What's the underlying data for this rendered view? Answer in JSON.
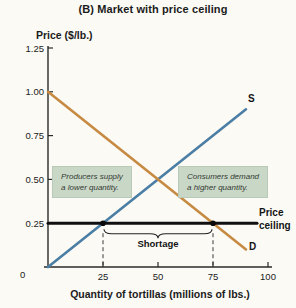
{
  "title": "(B) Market with price ceiling",
  "chart_data": {
    "type": "line",
    "title": "(B) Market with price ceiling",
    "xlabel": "Quantity of tortillas (millions of lbs.)",
    "ylabel": "Price ($/lb.)",
    "xlim": [
      0,
      100
    ],
    "ylim": [
      0,
      1.25
    ],
    "grid": false,
    "origin_label": "0",
    "x_ticks": [
      {
        "v": 25,
        "label": "25"
      },
      {
        "v": 50,
        "label": "50"
      },
      {
        "v": 75,
        "label": "75"
      },
      {
        "v": 100,
        "label": "100"
      }
    ],
    "y_ticks": [
      {
        "v": 0.25,
        "label": "0.25"
      },
      {
        "v": 0.5,
        "label": "0.50"
      },
      {
        "v": 0.75,
        "label": "0.75"
      },
      {
        "v": 1.0,
        "label": "1.00"
      },
      {
        "v": 1.25,
        "label": "1.25"
      }
    ],
    "series": [
      {
        "name": "S",
        "role": "supply",
        "color": "#4b7ea4",
        "width": 2.6,
        "points": [
          [
            0,
            0.0
          ],
          [
            90,
            0.9
          ]
        ]
      },
      {
        "name": "D",
        "role": "demand",
        "color": "#c68a42",
        "width": 2.6,
        "points": [
          [
            0,
            1.0
          ],
          [
            90,
            0.1
          ]
        ]
      },
      {
        "name": "Price ceiling",
        "role": "price-ceiling",
        "color": "#101010",
        "width": 3,
        "points": [
          [
            0,
            0.25
          ],
          [
            95,
            0.25
          ]
        ]
      }
    ],
    "markers": [
      {
        "x": 25,
        "y": 0.25,
        "meaning": "quantity supplied at ceiling"
      },
      {
        "x": 75,
        "y": 0.25,
        "meaning": "quantity demanded at ceiling"
      }
    ],
    "shortage": {
      "label": "Shortage",
      "from": 25,
      "to": 75,
      "at_price": 0.25
    },
    "annotations": [
      {
        "id": "producers",
        "lines": [
          "Producers supply",
          "a lower quantity."
        ]
      },
      {
        "id": "consumers",
        "lines": [
          "Consumers demand",
          "a higher quantity."
        ]
      }
    ],
    "price_ceiling_label": {
      "lines": [
        "Price",
        "ceiling"
      ]
    },
    "colors": {
      "supply": "#4b7ea4",
      "demand": "#c68a42",
      "ceiling": "#101010",
      "annotation_bg": "#c9d7c7",
      "paper": "#fbfaf5"
    }
  }
}
